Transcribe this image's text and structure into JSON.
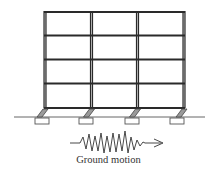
{
  "figure": {
    "caption": "Ground motion",
    "colors": {
      "frame": "#2a2a2a",
      "pad": "#555555",
      "damper_fill": "#9a9a9a",
      "ground": "#555555"
    },
    "frame": {
      "bays": 3,
      "stories": 4,
      "column_x": [
        44,
        91,
        137,
        184
      ],
      "floor_y": [
        11,
        35,
        59,
        83,
        108
      ]
    },
    "supports": {
      "count": 4,
      "type": "inclined isolator on footing pad"
    },
    "ground_line_y": 117,
    "excitation": {
      "type": "oscillating waveform with arrow",
      "direction": "right"
    }
  }
}
